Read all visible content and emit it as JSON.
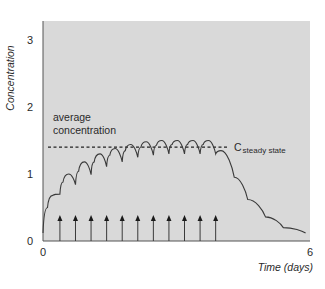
{
  "chart_data": {
    "type": "line",
    "title": "",
    "xlabel": "Time (days)",
    "ylabel": "Concentration",
    "xlim": [
      0,
      6
    ],
    "ylim": [
      0,
      3.2
    ],
    "x_ticks": [
      "0",
      "6"
    ],
    "y_ticks": [
      "0",
      "1",
      "2",
      "3"
    ],
    "grid": false,
    "legend": null,
    "background_color": "#d9d9d9",
    "line_color": "#3a3a3a",
    "series": [
      {
        "name": "Concentration",
        "x": [
          0.0,
          0.1,
          0.22,
          0.38,
          0.45,
          0.58,
          0.73,
          0.8,
          0.93,
          1.08,
          1.15,
          1.28,
          1.43,
          1.5,
          1.62,
          1.78,
          1.85,
          1.97,
          2.13,
          2.2,
          2.32,
          2.48,
          2.55,
          2.67,
          2.83,
          2.9,
          3.02,
          3.18,
          3.25,
          3.37,
          3.53,
          3.6,
          3.72,
          3.88,
          4.0,
          4.3,
          4.6,
          5.0,
          5.4,
          5.9
        ],
        "y": [
          0.12,
          0.5,
          0.68,
          0.7,
          0.88,
          1.0,
          0.84,
          1.04,
          1.18,
          0.99,
          1.18,
          1.3,
          1.11,
          1.28,
          1.38,
          1.18,
          1.35,
          1.44,
          1.25,
          1.4,
          1.48,
          1.28,
          1.43,
          1.5,
          1.3,
          1.44,
          1.5,
          1.3,
          1.44,
          1.5,
          1.3,
          1.44,
          1.5,
          1.3,
          1.35,
          0.95,
          0.62,
          0.36,
          0.2,
          0.12
        ]
      }
    ],
    "steady_state": {
      "value": 1.4,
      "label_main": "C",
      "label_sub": "steady state",
      "style": "dashed"
    },
    "doses": {
      "label": "dose times (arrows)",
      "times": [
        0.38,
        0.73,
        1.08,
        1.43,
        1.78,
        2.13,
        2.48,
        2.83,
        3.18,
        3.53,
        3.88
      ],
      "count": 11
    },
    "annotations": [
      {
        "text_line1": "average",
        "text_line2": "concentration"
      }
    ]
  }
}
